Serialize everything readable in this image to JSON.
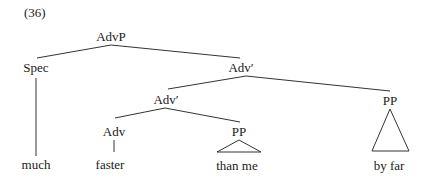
{
  "example": {
    "number": "(36)"
  },
  "tree": {
    "nodes": {
      "advp": {
        "label": "AdvP"
      },
      "spec": {
        "label": "Spec"
      },
      "adv_bar_upper": {
        "label": "Adv′"
      },
      "adv_bar_lower": {
        "label": "Adv′"
      },
      "adv": {
        "label": "Adv"
      },
      "pp_than": {
        "label": "PP"
      },
      "pp_by": {
        "label": "PP"
      }
    },
    "leaves": {
      "much": {
        "label": "much"
      },
      "faster": {
        "label": "faster"
      },
      "than_me": {
        "label": "than me"
      },
      "by_far": {
        "label": "by far"
      }
    },
    "structure": [
      "AdvP -> Spec, Adv'",
      "Spec -> much",
      "Adv' -> Adv', PP",
      "Adv' -> Adv, PP",
      "Adv -> faster",
      "PP -> than me (triangle)",
      "PP -> by far (triangle)"
    ]
  }
}
